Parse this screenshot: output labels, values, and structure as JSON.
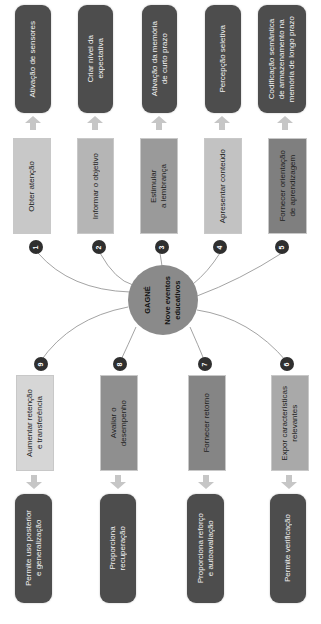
{
  "hub": {
    "title": "GAGNÉ",
    "subtitle": "Nove eventos\neducativos",
    "color": "#8a8a8a"
  },
  "events": [
    {
      "number": "1",
      "label": "Obter atenção",
      "outcome": "Ativação de sensores",
      "color": "#c8c8c8"
    },
    {
      "number": "2",
      "label": "Informar o objetivo",
      "outcome": "Criar nível da\nexpectativa",
      "color": "#b5b5b5"
    },
    {
      "number": "3",
      "label": "Estimular\na lembrança",
      "outcome": "Ativação da memória\nde curto prazo",
      "color": "#9a9a9a"
    },
    {
      "number": "4",
      "label": "Apresentar conteúdo",
      "outcome": "Percepção seletiva",
      "color": "#c2c2c2"
    },
    {
      "number": "5",
      "label": "Fornecer orientação\nde aprendizagem",
      "outcome": "Codificação semântica\nde armazenamento na\nmemória de longo prazo",
      "color": "#7f7f7f"
    },
    {
      "number": "6",
      "label": "Expor características\nrelevantes",
      "outcome": "Permite verificação",
      "color": "#a9a9a9"
    },
    {
      "number": "7",
      "label": "Fornecer retorno",
      "outcome": "Proporciona reforço\ne autoavaliação",
      "color": "#858585"
    },
    {
      "number": "8",
      "label": "Avaliar o\ndesempenho",
      "outcome": "Proporciona\nrecuperação",
      "color": "#8f8f8f"
    },
    {
      "number": "9",
      "label": "Aumentar retenção\ne transferência",
      "outcome": "Permite uso posterior\ne generalização",
      "color": "#d6d6d6"
    }
  ],
  "colors": {
    "outcome_box": "#4d4d4d",
    "arrow": "#c6c6c6",
    "badge": "#2f2f2f",
    "connector": "#8c8c8c"
  }
}
